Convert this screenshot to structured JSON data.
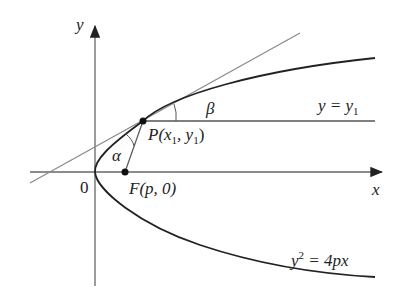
{
  "labels": {
    "y_axis": "y",
    "x_axis": "x",
    "origin": "0",
    "point_P": "P(x",
    "point_P_sub": "1",
    "point_P_sep": ", y",
    "point_P_sub2": "1",
    "point_P_close": ")",
    "focus": "F(p, 0)",
    "alpha": "α",
    "beta": "β",
    "horizontal_line": "y = y",
    "horizontal_line_sub": "1",
    "parabola_eq_pre": "y",
    "parabola_eq_sup": "2",
    "parabola_eq_post": " = 4px"
  },
  "colors": {
    "curve": "#222222",
    "axis": "#555555",
    "tangent": "#888888"
  }
}
